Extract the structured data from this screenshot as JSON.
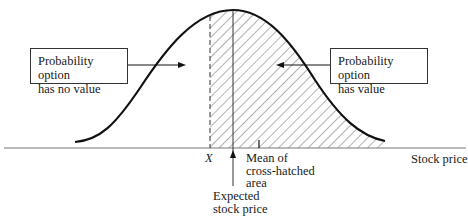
{
  "diagram": {
    "type": "distribution-diagram",
    "left_box": {
      "line1": "Probability option",
      "line2": "has no value"
    },
    "right_box": {
      "line1": "Probability option",
      "line2": "has value"
    },
    "strike_label": "X",
    "mean_label": {
      "line1": "Mean of",
      "line2": "cross-hatched",
      "line3": "area"
    },
    "expected_label": {
      "line1": "Expected",
      "line2": "stock price"
    },
    "axis_label": "Stock price",
    "colors": {
      "line": "#111111",
      "axis": "#777777",
      "hatch": "#555555",
      "background": "#ffffff"
    }
  }
}
